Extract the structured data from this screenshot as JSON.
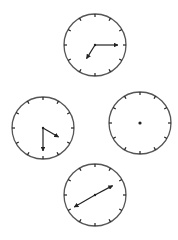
{
  "figure": {
    "stroke_color": "#222222",
    "face_color": "#ffffff",
    "clocks": [
      {
        "id": "top",
        "center": [
          95,
          45
        ],
        "radius": 31,
        "ticks": 12,
        "hands": [
          {
            "role": "minute",
            "angle_deg": 90,
            "length": 23
          },
          {
            "role": "hour",
            "angle_deg": 212,
            "length": 16
          }
        ],
        "center_dot": false
      },
      {
        "id": "left",
        "center": [
          43,
          128
        ],
        "radius": 31,
        "ticks": 12,
        "hands": [
          {
            "role": "minute",
            "angle_deg": 180,
            "length": 23
          },
          {
            "role": "hour",
            "angle_deg": 120,
            "length": 18
          }
        ],
        "center_dot": false
      },
      {
        "id": "right",
        "center": [
          140,
          123
        ],
        "radius": 31,
        "ticks": 12,
        "hands": [],
        "center_dot": true
      },
      {
        "id": "bottom",
        "center": [
          95,
          195
        ],
        "radius": 31,
        "ticks": 12,
        "hands": [
          {
            "role": "hour",
            "angle_deg": 62,
            "length": 20
          },
          {
            "role": "minute",
            "angle_deg": 240,
            "length": 24
          }
        ],
        "center_dot": false
      }
    ]
  }
}
